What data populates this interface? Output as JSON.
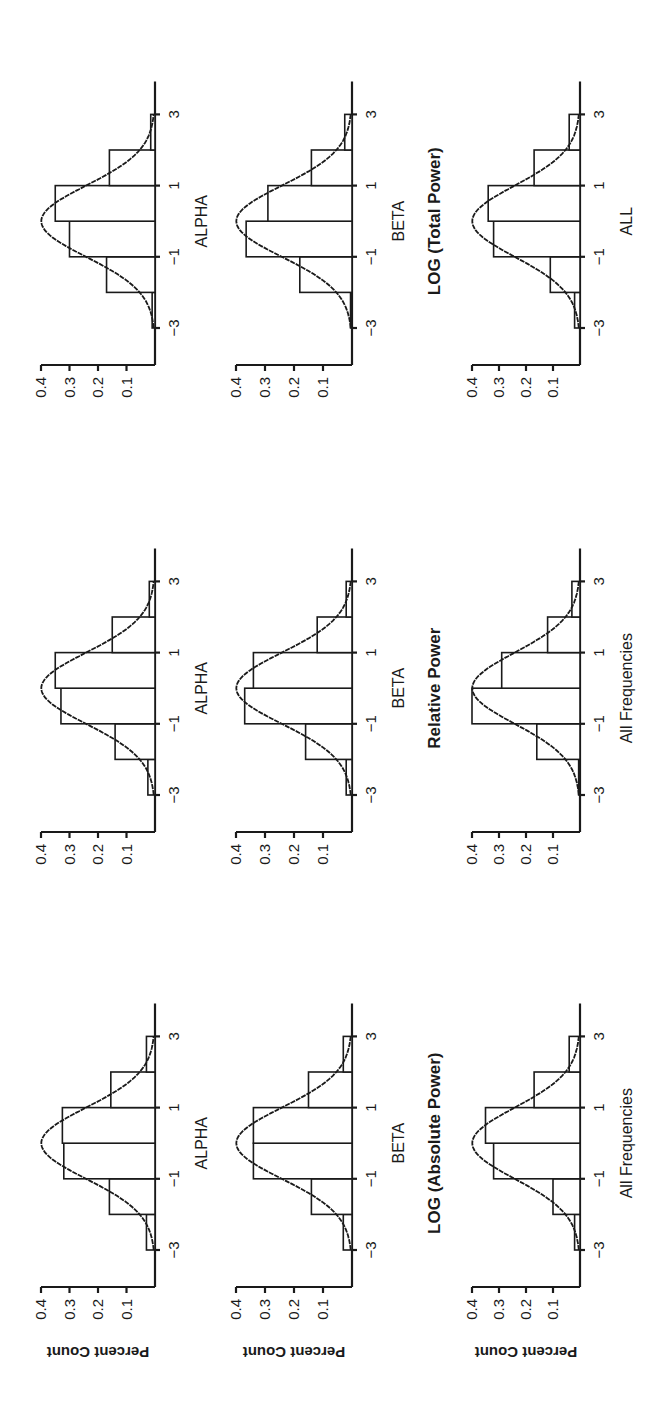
{
  "figure": {
    "orientation_note": "rotated 90 degrees counter-clockwise",
    "ylabel": "Percent Count",
    "yticks": [
      "0.1",
      "0.2",
      "0.3",
      "0.4"
    ],
    "xticks": [
      "−3",
      "−1",
      "1",
      "3"
    ]
  },
  "chart_data": [
    {
      "type": "bar",
      "row": 1,
      "col": 1,
      "title": "",
      "xlabel": "ALPHA",
      "ylabel": "Percent Count",
      "bin_edges": [
        -3,
        -2,
        -1,
        0,
        1,
        2,
        3
      ],
      "values": [
        0.03,
        0.16,
        0.32,
        0.325,
        0.155,
        0.03
      ],
      "overlay": "normal density curve",
      "xticks": [
        -3,
        -1,
        1,
        3
      ],
      "yticks": [
        0.1,
        0.2,
        0.3,
        0.4
      ],
      "ylim": [
        0,
        0.4
      ],
      "xlim": [
        -3,
        3
      ]
    },
    {
      "type": "bar",
      "row": 1,
      "col": 2,
      "title": "",
      "xlabel": "ALPHA",
      "ylabel": "",
      "bin_edges": [
        -3,
        -2,
        -1,
        0,
        1,
        2,
        3
      ],
      "values": [
        0.025,
        0.14,
        0.33,
        0.35,
        0.15,
        0.02
      ],
      "overlay": "normal density curve",
      "xticks": [
        -3,
        -1,
        1,
        3
      ],
      "yticks": [
        0.1,
        0.2,
        0.3,
        0.4
      ],
      "ylim": [
        0,
        0.4
      ],
      "xlim": [
        -3,
        3
      ]
    },
    {
      "type": "bar",
      "row": 1,
      "col": 3,
      "title": "",
      "xlabel": "ALPHA",
      "ylabel": "",
      "bin_edges": [
        -3,
        -2,
        -1,
        0,
        1,
        2,
        3
      ],
      "values": [
        0.01,
        0.17,
        0.3,
        0.35,
        0.16,
        0.015
      ],
      "overlay": "normal density curve",
      "xticks": [
        -3,
        -1,
        1,
        3
      ],
      "yticks": [
        0.1,
        0.2,
        0.3,
        0.4
      ],
      "ylim": [
        0,
        0.4
      ],
      "xlim": [
        -3,
        3
      ]
    },
    {
      "type": "bar",
      "row": 2,
      "col": 1,
      "title": "",
      "xlabel": "BETA",
      "ylabel": "Percent Count",
      "bin_edges": [
        -3,
        -2,
        -1,
        0,
        1,
        2,
        3
      ],
      "values": [
        0.03,
        0.14,
        0.34,
        0.34,
        0.15,
        0.03
      ],
      "overlay": "normal density curve",
      "xticks": [
        -3,
        -1,
        1,
        3
      ],
      "yticks": [
        0.1,
        0.2,
        0.3,
        0.4
      ],
      "ylim": [
        0,
        0.4
      ],
      "xlim": [
        -3,
        3
      ]
    },
    {
      "type": "bar",
      "row": 2,
      "col": 2,
      "title": "",
      "xlabel": "BETA",
      "ylabel": "",
      "bin_edges": [
        -3,
        -2,
        -1,
        0,
        1,
        2,
        3
      ],
      "values": [
        0.02,
        0.16,
        0.37,
        0.34,
        0.12,
        0.02
      ],
      "overlay": "normal density curve",
      "xticks": [
        -3,
        -1,
        1,
        3
      ],
      "yticks": [
        0.1,
        0.2,
        0.3,
        0.4
      ],
      "ylim": [
        0,
        0.4
      ],
      "xlim": [
        -3,
        3
      ]
    },
    {
      "type": "bar",
      "row": 2,
      "col": 3,
      "title": "",
      "xlabel": "BETA",
      "ylabel": "",
      "bin_edges": [
        -3,
        -2,
        -1,
        0,
        1,
        2,
        3
      ],
      "values": [
        0.005,
        0.18,
        0.365,
        0.29,
        0.14,
        0.025
      ],
      "overlay": "normal density curve",
      "xticks": [
        -3,
        -1,
        1,
        3
      ],
      "yticks": [
        0.1,
        0.2,
        0.3,
        0.4
      ],
      "ylim": [
        0,
        0.4
      ],
      "xlim": [
        -3,
        3
      ]
    },
    {
      "type": "bar",
      "row": 3,
      "col": 1,
      "title": "LOG (Absolute Power)",
      "xlabel": "All Frequencies",
      "ylabel": "Percent Count",
      "bin_edges": [
        -3,
        -2,
        -1,
        0,
        1,
        2,
        3
      ],
      "values": [
        0.02,
        0.1,
        0.32,
        0.35,
        0.17,
        0.04
      ],
      "overlay": "normal density curve",
      "xticks": [
        -3,
        -1,
        1,
        3
      ],
      "yticks": [
        0.1,
        0.2,
        0.3,
        0.4
      ],
      "ylim": [
        0,
        0.4
      ],
      "xlim": [
        -3,
        3
      ]
    },
    {
      "type": "bar",
      "row": 3,
      "col": 2,
      "title": "Relative Power",
      "xlabel": "All Frequencies",
      "ylabel": "",
      "bin_edges": [
        -3,
        -2,
        -1,
        0,
        1,
        2,
        3
      ],
      "values": [
        0.005,
        0.16,
        0.4,
        0.29,
        0.12,
        0.03
      ],
      "overlay": "normal density curve",
      "xticks": [
        -3,
        -1,
        1,
        3
      ],
      "yticks": [
        0.1,
        0.2,
        0.3,
        0.4
      ],
      "ylim": [
        0,
        0.4
      ],
      "xlim": [
        -3,
        3
      ]
    },
    {
      "type": "bar",
      "row": 3,
      "col": 3,
      "title": "LOG (Total Power)",
      "xlabel": "ALL",
      "ylabel": "",
      "bin_edges": [
        -3,
        -2,
        -1,
        0,
        1,
        2,
        3
      ],
      "values": [
        0.02,
        0.11,
        0.32,
        0.34,
        0.17,
        0.04
      ],
      "overlay": "normal density curve",
      "xticks": [
        -3,
        -1,
        1,
        3
      ],
      "yticks": [
        0.1,
        0.2,
        0.3,
        0.4
      ],
      "ylim": [
        0,
        0.4
      ],
      "xlim": [
        -3,
        3
      ]
    }
  ]
}
